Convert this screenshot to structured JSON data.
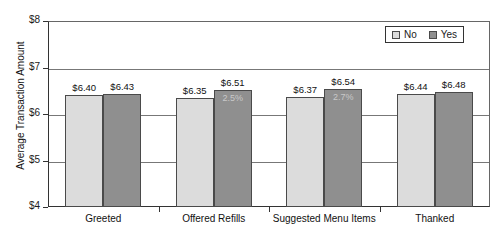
{
  "chart_data": {
    "type": "bar",
    "title": "",
    "xlabel": "",
    "ylabel": "Average Transaction Amount",
    "ylim": [
      4,
      8
    ],
    "ytick_labels": [
      "$4",
      "$5",
      "$6",
      "$7",
      "$8"
    ],
    "ytick_values": [
      4,
      5,
      6,
      7,
      8
    ],
    "grid": true,
    "legend_position": "top-right",
    "categories": [
      "Greeted",
      "Offered Refills",
      "Suggested Menu Items",
      "Thanked"
    ],
    "series": [
      {
        "name": "No",
        "color": "#dcdcdc",
        "values": [
          6.4,
          6.35,
          6.37,
          6.44
        ],
        "labels": [
          "$6.40",
          "$6.35",
          "$6.37",
          "$6.44"
        ]
      },
      {
        "name": "Yes",
        "color": "#8f8f8f",
        "values": [
          6.43,
          6.51,
          6.54,
          6.48
        ],
        "labels": [
          "$6.43",
          "$6.51",
          "$6.54",
          "$6.48"
        ]
      }
    ],
    "annotations": [
      {
        "group": "Offered Refills",
        "series": "Yes",
        "text": "2.5%"
      },
      {
        "group": "Suggested Menu Items",
        "series": "Yes",
        "text": "2.7%"
      }
    ]
  },
  "legend": {
    "entries": [
      {
        "label": "No"
      },
      {
        "label": "Yes"
      }
    ]
  }
}
